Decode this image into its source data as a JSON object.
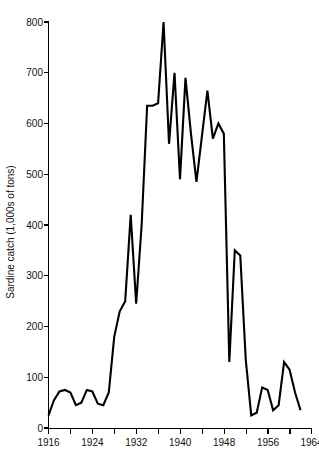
{
  "chart_data": {
    "type": "line",
    "title": "",
    "subtitle": "",
    "xlabel": "",
    "ylabel": "Sardine catch (1,000s of tons)",
    "xlim": [
      1916,
      1964
    ],
    "ylim": [
      0,
      800
    ],
    "grid": false,
    "legend": false,
    "legend_position": "none",
    "line_color": "#000000",
    "background_color": "#ffffff",
    "x_major_ticks": [
      1916,
      1924,
      1932,
      1940,
      1948,
      1956,
      1964
    ],
    "x_major_tick_labels": [
      "1916",
      "1924",
      "1932",
      "1940",
      "1948",
      "1956",
      "1964"
    ],
    "x_minor_ticks": [
      1920,
      1928,
      1936,
      1944,
      1952,
      1960
    ],
    "y_ticks": [
      0,
      100,
      200,
      300,
      400,
      500,
      600,
      700,
      800
    ],
    "y_tick_labels": [
      "0",
      "100",
      "200",
      "300",
      "400",
      "500",
      "600",
      "700",
      "800"
    ],
    "x": [
      1916,
      1917,
      1918,
      1919,
      1920,
      1921,
      1922,
      1923,
      1924,
      1925,
      1926,
      1927,
      1928,
      1929,
      1930,
      1931,
      1932,
      1933,
      1934,
      1935,
      1936,
      1937,
      1938,
      1939,
      1940,
      1941,
      1942,
      1943,
      1944,
      1945,
      1946,
      1947,
      1948,
      1949,
      1950,
      1951,
      1952,
      1953,
      1954,
      1955,
      1956,
      1957,
      1958,
      1959,
      1960,
      1961,
      1962
    ],
    "values": [
      25,
      55,
      72,
      75,
      70,
      45,
      50,
      75,
      72,
      48,
      45,
      70,
      180,
      230,
      250,
      420,
      245,
      400,
      635,
      635,
      640,
      800,
      560,
      700,
      490,
      690,
      580,
      485,
      575,
      665,
      570,
      600,
      580,
      130,
      350,
      340,
      135,
      25,
      30,
      80,
      75,
      35,
      45,
      130,
      115,
      70,
      35
    ],
    "series": [
      {
        "name": "Sardine catch",
        "values": [
          25,
          55,
          72,
          75,
          70,
          45,
          50,
          75,
          72,
          48,
          45,
          70,
          180,
          230,
          250,
          420,
          245,
          400,
          635,
          635,
          640,
          800,
          560,
          700,
          490,
          690,
          580,
          485,
          575,
          665,
          570,
          600,
          580,
          130,
          350,
          340,
          135,
          25,
          30,
          80,
          75,
          35,
          45,
          130,
          115,
          70,
          35
        ]
      }
    ],
    "annotations": [],
    "units": "1,000s of tons",
    "peak_value": 800,
    "peak_year": 1937
  },
  "axes": {
    "y_title": "Sardine catch (1,000s of tons)"
  }
}
